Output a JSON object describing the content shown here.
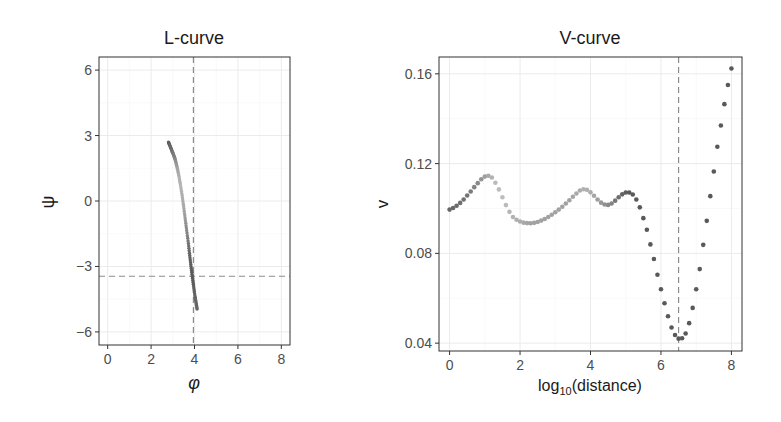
{
  "chart_data": [
    {
      "type": "scatter",
      "title": "L-curve",
      "xlabel": "φ",
      "ylabel": "ψ",
      "xlim": [
        -0.4,
        8.4
      ],
      "ylim": [
        -6.6,
        6.6
      ],
      "xticks": [
        0,
        2,
        4,
        6,
        8
      ],
      "yticks": [
        6,
        3,
        0,
        -3,
        -6
      ],
      "grid": true,
      "reference_lines": {
        "vline_x": 3.95,
        "hline_y": -3.45,
        "style": "dashed"
      },
      "points": [
        {
          "x": 2.8,
          "y": 2.7,
          "shade": 0.25
        },
        {
          "x": 2.86,
          "y": 2.55,
          "shade": 0.28
        },
        {
          "x": 2.93,
          "y": 2.38,
          "shade": 0.32
        },
        {
          "x": 3.0,
          "y": 2.2,
          "shade": 0.38
        },
        {
          "x": 3.08,
          "y": 2.0,
          "shade": 0.45
        },
        {
          "x": 3.15,
          "y": 1.75,
          "shade": 0.55
        },
        {
          "x": 3.22,
          "y": 1.45,
          "shade": 0.65
        },
        {
          "x": 3.29,
          "y": 1.1,
          "shade": 0.72
        },
        {
          "x": 3.36,
          "y": 0.7,
          "shade": 0.75
        },
        {
          "x": 3.43,
          "y": 0.25,
          "shade": 0.72
        },
        {
          "x": 3.5,
          "y": -0.25,
          "shade": 0.68
        },
        {
          "x": 3.57,
          "y": -0.8,
          "shade": 0.6
        },
        {
          "x": 3.64,
          "y": -1.35,
          "shade": 0.5
        },
        {
          "x": 3.72,
          "y": -1.95,
          "shade": 0.38
        },
        {
          "x": 3.78,
          "y": -2.5,
          "shade": 0.28
        },
        {
          "x": 3.84,
          "y": -3.0,
          "shade": 0.25
        },
        {
          "x": 3.9,
          "y": -3.45,
          "shade": 0.22
        },
        {
          "x": 3.96,
          "y": -3.9,
          "shade": 0.25
        },
        {
          "x": 4.02,
          "y": -4.35,
          "shade": 0.28
        },
        {
          "x": 4.08,
          "y": -4.7,
          "shade": 0.3
        },
        {
          "x": 4.12,
          "y": -4.95,
          "shade": 0.3
        }
      ]
    },
    {
      "type": "scatter",
      "title": "V-curve",
      "xlabel": "log10(distance)",
      "xlabel_base": "log",
      "xlabel_sub": "10",
      "xlabel_rest": "(distance)",
      "ylabel": "v",
      "xlim": [
        -0.3,
        8.3
      ],
      "ylim": [
        0.0365,
        0.1675
      ],
      "xticks": [
        0,
        2,
        4,
        6,
        8
      ],
      "yticks": [
        0.16,
        0.12,
        0.08,
        0.04
      ],
      "ytick_labels": [
        "0.16",
        "0.12",
        "0.08",
        "0.04"
      ],
      "grid": true,
      "reference_lines": {
        "vline_x": 6.5,
        "style": "dashed"
      },
      "points": [
        {
          "x": 0.0,
          "y": 0.0995,
          "shade": 0.3
        },
        {
          "x": 0.1,
          "y": 0.1002,
          "shade": 0.3
        },
        {
          "x": 0.2,
          "y": 0.1012,
          "shade": 0.32
        },
        {
          "x": 0.3,
          "y": 0.1025,
          "shade": 0.34
        },
        {
          "x": 0.4,
          "y": 0.104,
          "shade": 0.36
        },
        {
          "x": 0.5,
          "y": 0.1058,
          "shade": 0.38
        },
        {
          "x": 0.6,
          "y": 0.1076,
          "shade": 0.42
        },
        {
          "x": 0.7,
          "y": 0.1095,
          "shade": 0.46
        },
        {
          "x": 0.8,
          "y": 0.1113,
          "shade": 0.5
        },
        {
          "x": 0.9,
          "y": 0.113,
          "shade": 0.56
        },
        {
          "x": 1.0,
          "y": 0.1142,
          "shade": 0.62
        },
        {
          "x": 1.1,
          "y": 0.1146,
          "shade": 0.68
        },
        {
          "x": 1.2,
          "y": 0.1138,
          "shade": 0.74
        },
        {
          "x": 1.3,
          "y": 0.1115,
          "shade": 0.78
        },
        {
          "x": 1.4,
          "y": 0.1085,
          "shade": 0.8
        },
        {
          "x": 1.5,
          "y": 0.105,
          "shade": 0.8
        },
        {
          "x": 1.6,
          "y": 0.1015,
          "shade": 0.78
        },
        {
          "x": 1.7,
          "y": 0.0985,
          "shade": 0.76
        },
        {
          "x": 1.8,
          "y": 0.0962,
          "shade": 0.74
        },
        {
          "x": 1.9,
          "y": 0.095,
          "shade": 0.72
        },
        {
          "x": 2.0,
          "y": 0.0942,
          "shade": 0.7
        },
        {
          "x": 2.1,
          "y": 0.0937,
          "shade": 0.68
        },
        {
          "x": 2.2,
          "y": 0.0935,
          "shade": 0.66
        },
        {
          "x": 2.3,
          "y": 0.0934,
          "shade": 0.64
        },
        {
          "x": 2.4,
          "y": 0.0936,
          "shade": 0.64
        },
        {
          "x": 2.5,
          "y": 0.094,
          "shade": 0.64
        },
        {
          "x": 2.6,
          "y": 0.0946,
          "shade": 0.64
        },
        {
          "x": 2.7,
          "y": 0.0953,
          "shade": 0.64
        },
        {
          "x": 2.8,
          "y": 0.0962,
          "shade": 0.64
        },
        {
          "x": 2.9,
          "y": 0.0972,
          "shade": 0.64
        },
        {
          "x": 3.0,
          "y": 0.0983,
          "shade": 0.64
        },
        {
          "x": 3.1,
          "y": 0.0995,
          "shade": 0.64
        },
        {
          "x": 3.2,
          "y": 0.1008,
          "shade": 0.64
        },
        {
          "x": 3.3,
          "y": 0.1022,
          "shade": 0.64
        },
        {
          "x": 3.4,
          "y": 0.1037,
          "shade": 0.64
        },
        {
          "x": 3.5,
          "y": 0.1052,
          "shade": 0.66
        },
        {
          "x": 3.6,
          "y": 0.1067,
          "shade": 0.68
        },
        {
          "x": 3.7,
          "y": 0.108,
          "shade": 0.7
        },
        {
          "x": 3.8,
          "y": 0.1086,
          "shade": 0.72
        },
        {
          "x": 3.9,
          "y": 0.1083,
          "shade": 0.72
        },
        {
          "x": 4.0,
          "y": 0.1072,
          "shade": 0.7
        },
        {
          "x": 4.1,
          "y": 0.1057,
          "shade": 0.66
        },
        {
          "x": 4.2,
          "y": 0.104,
          "shade": 0.62
        },
        {
          "x": 4.3,
          "y": 0.1026,
          "shade": 0.58
        },
        {
          "x": 4.4,
          "y": 0.1018,
          "shade": 0.54
        },
        {
          "x": 4.5,
          "y": 0.1016,
          "shade": 0.5
        },
        {
          "x": 4.6,
          "y": 0.1022,
          "shade": 0.46
        },
        {
          "x": 4.7,
          "y": 0.1035,
          "shade": 0.4
        },
        {
          "x": 4.8,
          "y": 0.105,
          "shade": 0.34
        },
        {
          "x": 4.9,
          "y": 0.1063,
          "shade": 0.28
        },
        {
          "x": 5.0,
          "y": 0.1071,
          "shade": 0.24
        },
        {
          "x": 5.1,
          "y": 0.1071,
          "shade": 0.22
        },
        {
          "x": 5.2,
          "y": 0.1062,
          "shade": 0.22
        },
        {
          "x": 5.3,
          "y": 0.104,
          "shade": 0.22
        },
        {
          "x": 5.4,
          "y": 0.1005,
          "shade": 0.22
        },
        {
          "x": 5.5,
          "y": 0.0957,
          "shade": 0.22
        },
        {
          "x": 5.6,
          "y": 0.0905,
          "shade": 0.22
        },
        {
          "x": 5.7,
          "y": 0.084,
          "shade": 0.22
        },
        {
          "x": 5.8,
          "y": 0.0775,
          "shade": 0.22
        },
        {
          "x": 5.9,
          "y": 0.0705,
          "shade": 0.22
        },
        {
          "x": 6.0,
          "y": 0.064,
          "shade": 0.22
        },
        {
          "x": 6.1,
          "y": 0.0578,
          "shade": 0.22
        },
        {
          "x": 6.2,
          "y": 0.052,
          "shade": 0.22
        },
        {
          "x": 6.3,
          "y": 0.047,
          "shade": 0.22
        },
        {
          "x": 6.4,
          "y": 0.0436,
          "shade": 0.22
        },
        {
          "x": 6.5,
          "y": 0.042,
          "shade": 0.22
        },
        {
          "x": 6.6,
          "y": 0.0422,
          "shade": 0.22
        },
        {
          "x": 6.7,
          "y": 0.0443,
          "shade": 0.22
        },
        {
          "x": 6.8,
          "y": 0.0489,
          "shade": 0.22
        },
        {
          "x": 6.9,
          "y": 0.0557,
          "shade": 0.22
        },
        {
          "x": 7.0,
          "y": 0.064,
          "shade": 0.22
        },
        {
          "x": 7.1,
          "y": 0.073,
          "shade": 0.22
        },
        {
          "x": 7.2,
          "y": 0.0838,
          "shade": 0.22
        },
        {
          "x": 7.3,
          "y": 0.0945,
          "shade": 0.22
        },
        {
          "x": 7.4,
          "y": 0.1055,
          "shade": 0.22
        },
        {
          "x": 7.5,
          "y": 0.1165,
          "shade": 0.22
        },
        {
          "x": 7.6,
          "y": 0.1275,
          "shade": 0.22
        },
        {
          "x": 7.7,
          "y": 0.137,
          "shade": 0.22
        },
        {
          "x": 7.8,
          "y": 0.1465,
          "shade": 0.22
        },
        {
          "x": 7.9,
          "y": 0.155,
          "shade": 0.22
        },
        {
          "x": 8.0,
          "y": 0.1624,
          "shade": 0.22
        }
      ]
    }
  ],
  "layout": {
    "panels": [
      {
        "left": 99,
        "top": 57,
        "right": 290,
        "bottom": 345
      },
      {
        "left": 439,
        "top": 57,
        "right": 742,
        "bottom": 351
      }
    ]
  },
  "colors": {
    "axis_text": "#4d4d4d",
    "title_text": "#1a1a1a",
    "panel_border": "#333333",
    "grid_major": "#ebebeb",
    "grid_minor": "#f5f5f5",
    "reference_line": "#8c8c8c",
    "point_dark": "#333333"
  }
}
